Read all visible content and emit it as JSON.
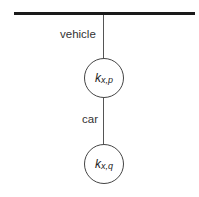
{
  "diagram": {
    "root_bar": "hierarchy-root",
    "edges": [
      {
        "label": "vehicle"
      },
      {
        "label": "car"
      }
    ],
    "nodes": [
      {
        "main": "k",
        "sub": "x,p"
      },
      {
        "main": "k",
        "sub": "x,q"
      }
    ]
  }
}
